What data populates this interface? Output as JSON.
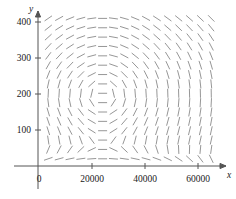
{
  "chart_data": {
    "type": "scatter",
    "plot_kind": "slope-field",
    "title": "",
    "subtitle": "",
    "xlabel": "x",
    "ylabel": "y",
    "xlim": [
      0,
      65000
    ],
    "ylim": [
      0,
      420
    ],
    "grid": false,
    "legend": null,
    "annotations": [],
    "x_ticks": [
      {
        "value": 0,
        "label": "0"
      },
      {
        "value": 20000,
        "label": "20000"
      },
      {
        "value": 40000,
        "label": "40000"
      },
      {
        "value": 60000,
        "label": "60000"
      }
    ],
    "y_ticks": [
      {
        "value": 100,
        "label": "100"
      },
      {
        "value": 200,
        "label": "200"
      },
      {
        "value": 300,
        "label": "300"
      },
      {
        "value": 400,
        "label": "400"
      }
    ],
    "field": {
      "description": "direction field of dashes over the region",
      "x_start": 3500,
      "x_step": 4100,
      "x_count": 16,
      "y_start": 20,
      "y_step": 26,
      "y_count": 16,
      "center": {
        "x": 24000,
        "y": 195
      },
      "segment_pixel_length": 9,
      "segment_color": "#8a8a8a"
    },
    "colors": {
      "axis": "#555555",
      "segment": "#8a8a8a",
      "text": "#1a1a1a",
      "background": "#ffffff"
    }
  },
  "axes": {
    "x_name": "x",
    "y_name": "y"
  }
}
